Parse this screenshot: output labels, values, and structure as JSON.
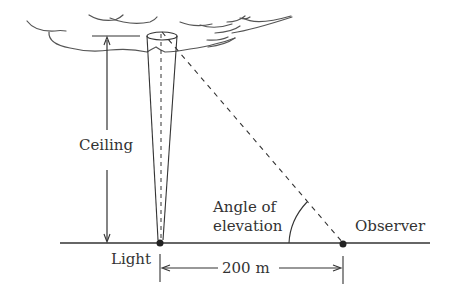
{
  "diagram": {
    "type": "trigonometry-ceiling-light",
    "labels": {
      "ceiling": "Ceiling",
      "angle": [
        "Angle of",
        "elevation"
      ],
      "observer": "Observer",
      "light": "Light",
      "distance": "200 m"
    },
    "colors": {
      "line": "#333333",
      "cloud": "#555555",
      "background": "#ffffff"
    }
  }
}
